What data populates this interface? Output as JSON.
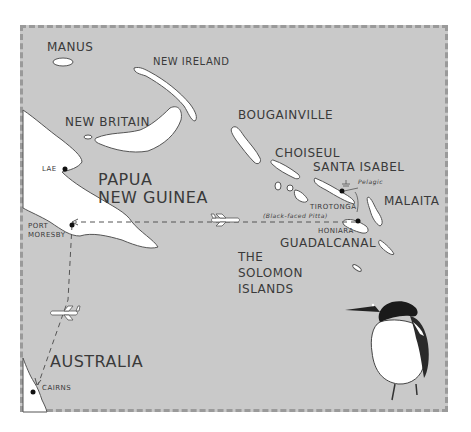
{
  "map": {
    "background_color": "#c9c9c9",
    "land_color": "#ffffff",
    "outline_color": "#555555",
    "regions": {
      "manus": "MANUS",
      "new_ireland": "NEW IRELAND",
      "new_britain": "NEW BRITAIN",
      "bougainville": "BOUGAINVILLE",
      "choiseul": "CHOISEUL",
      "santa_isabel": "SANTA ISABEL",
      "malaita": "MALAITA",
      "guadalcanal": "GUADALCANAL",
      "papua_line1": "PAPUA",
      "papua_line2": "NEW GUINEA",
      "solomon_line1": "THE",
      "solomon_line2": "SOLOMON",
      "solomon_line3": "ISLANDS",
      "australia": "AUSTRALIA"
    },
    "places": {
      "lae": "LAE",
      "port_moresby_line1": "PORT",
      "port_moresby_line2": "MORESBY",
      "cairns": "CAIRNS",
      "honiara": "HONIARA",
      "tirotonga": "TIROTONGA",
      "tirotonga_note": "(Black-faced Pitta)",
      "pelagic": "Pelagic"
    },
    "route": {
      "legs": [
        "Cairns → Port Moresby",
        "Port Moresby → Honiara"
      ],
      "icon": "airplane-icon"
    },
    "illustration": "bird-illustration"
  }
}
